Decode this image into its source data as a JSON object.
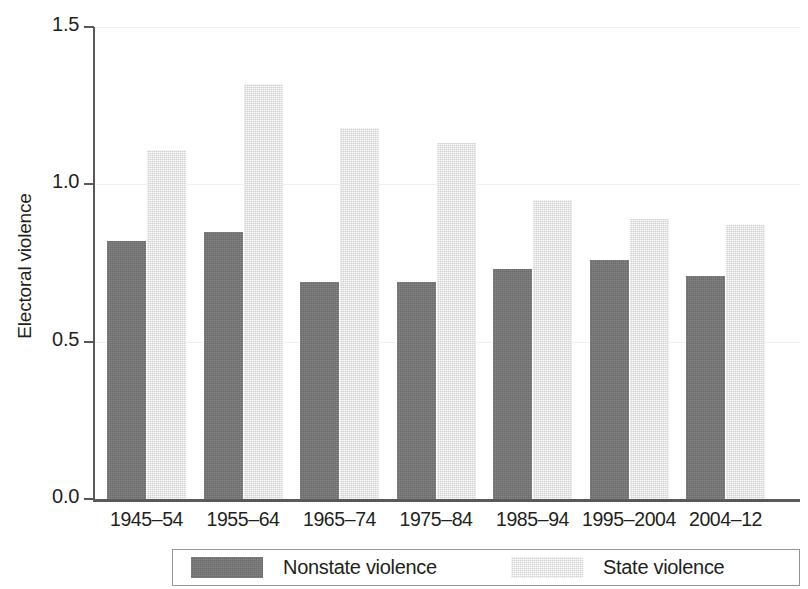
{
  "chart_data": {
    "type": "bar",
    "title": "",
    "xlabel": "",
    "ylabel": "Electoral violence",
    "categories": [
      "1945–54",
      "1955–64",
      "1965–74",
      "1975–84",
      "1985–94",
      "1995–2004",
      "2004–12"
    ],
    "series": [
      {
        "name": "Nonstate violence",
        "color": "#757575",
        "values": [
          0.82,
          0.85,
          0.69,
          0.69,
          0.73,
          0.76,
          0.71
        ]
      },
      {
        "name": "State violence",
        "color": "#e3e3e3",
        "values": [
          1.11,
          1.32,
          1.18,
          1.13,
          0.95,
          0.89,
          0.87
        ]
      }
    ],
    "ylim": [
      0.0,
      1.5
    ],
    "y_ticks": [
      0.0,
      0.5,
      1.0,
      1.5
    ],
    "y_tick_labels": [
      "0.0",
      "0.5",
      "1.0",
      "1.5"
    ],
    "grid": true,
    "grid_axis": "y",
    "legend_position": "bottom",
    "legend_boxed": true
  },
  "axes": {
    "y_title": "Electoral violence"
  },
  "legend": {
    "entries": [
      {
        "label": "Nonstate violence"
      },
      {
        "label": "State violence"
      }
    ]
  }
}
